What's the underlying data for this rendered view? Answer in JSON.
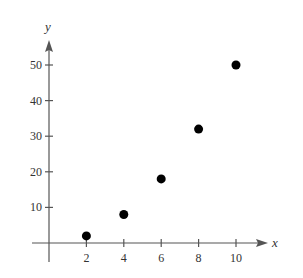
{
  "chart_data": {
    "type": "scatter",
    "title": "",
    "xlabel": "x",
    "ylabel": "y",
    "x": [
      2,
      4,
      6,
      8,
      10
    ],
    "series": [
      {
        "name": "points",
        "values": [
          2,
          8,
          18,
          32,
          50
        ]
      }
    ],
    "points": [
      {
        "x": 2,
        "y": 2
      },
      {
        "x": 4,
        "y": 8
      },
      {
        "x": 6,
        "y": 18
      },
      {
        "x": 8,
        "y": 32
      },
      {
        "x": 10,
        "y": 50
      }
    ],
    "xticks": [
      2,
      4,
      6,
      8,
      10
    ],
    "yticks": [
      10,
      20,
      30,
      40,
      50
    ],
    "xlim": [
      -0.8,
      12
    ],
    "ylim": [
      -3,
      57
    ],
    "grid": false,
    "legend": null
  },
  "axes": {
    "x_label": "x",
    "y_label": "y",
    "x_tick_labels": [
      "2",
      "4",
      "6",
      "8",
      "10"
    ],
    "y_tick_labels": [
      "10",
      "20",
      "30",
      "40",
      "50"
    ]
  },
  "style": {
    "point_color": "#000000",
    "axis_color": "#555555",
    "text_color": "#333333"
  }
}
